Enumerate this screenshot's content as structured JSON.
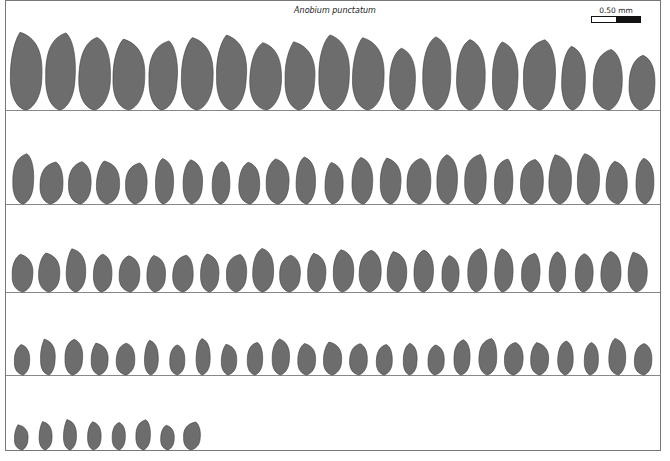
{
  "figure": {
    "title": "Anobium punctatum",
    "scale_bar": {
      "label": "0.50 mm",
      "segments": [
        "white",
        "black"
      ]
    },
    "colors": {
      "particle_fill": "#6d6d6d",
      "particle_stroke": "#3c3c3c",
      "frame": "#777777",
      "row_line": "#888888"
    },
    "rows": [
      {
        "index": 1,
        "particle_count": 19,
        "baseline_y": 110
      },
      {
        "index": 2,
        "particle_count": 23,
        "baseline_y": 204
      },
      {
        "index": 3,
        "particle_count": 24,
        "baseline_y": 292
      },
      {
        "index": 4,
        "particle_count": 25,
        "baseline_y": 375
      },
      {
        "index": 5,
        "particle_count": 8,
        "baseline_y": 450
      }
    ],
    "total_particles": 99
  }
}
